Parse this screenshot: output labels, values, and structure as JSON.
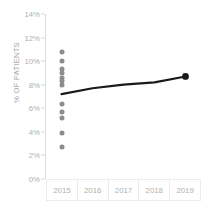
{
  "chart_data": {
    "type": "scatter",
    "title": "",
    "xlabel": "",
    "ylabel": "% OF PATIENTS",
    "categories": [
      "2015",
      "2016",
      "2017",
      "2018",
      "2019"
    ],
    "ylim": [
      0,
      14
    ],
    "ytick_labels": [
      "0%",
      "2%",
      "4%",
      "6%",
      "8%",
      "10%",
      "12%",
      "14%"
    ],
    "ytick_values": [
      0,
      2,
      4,
      6,
      8,
      10,
      12,
      14
    ],
    "grid": false,
    "legend": "none",
    "series": [
      {
        "name": "Individual site rates",
        "type": "scatter",
        "color": "#8c8c8c",
        "x": [
          "2015",
          "2015",
          "2015",
          "2015",
          "2015",
          "2015",
          "2015",
          "2015",
          "2015",
          "2015",
          "2015",
          "2015"
        ],
        "values": [
          10.8,
          10.0,
          9.3,
          9.0,
          8.6,
          8.3,
          8.0,
          6.4,
          5.7,
          5.2,
          3.9,
          2.7
        ]
      },
      {
        "name": "Overall rate",
        "type": "line",
        "color": "#1a1a1a",
        "categories": [
          "2015",
          "2016",
          "2017",
          "2018",
          "2019"
        ],
        "values": [
          7.2,
          7.7,
          8.0,
          8.2,
          8.7
        ],
        "marker_at": "2019",
        "marker_value": 8.7
      }
    ]
  },
  "axis": {
    "y_title": "% OF PATIENTS",
    "y_ticks": [
      {
        "label": "14%",
        "value": 14
      },
      {
        "label": "12%",
        "value": 12
      },
      {
        "label": "10%",
        "value": 10
      },
      {
        "label": "8%",
        "value": 8
      },
      {
        "label": "6%",
        "value": 6
      },
      {
        "label": "4%",
        "value": 4
      },
      {
        "label": "2%",
        "value": 2
      },
      {
        "label": "0%",
        "value": 0
      }
    ],
    "x_ticks": [
      {
        "label": "2015"
      },
      {
        "label": "2016"
      },
      {
        "label": "2017"
      },
      {
        "label": "2018"
      },
      {
        "label": "2019"
      }
    ]
  },
  "colors": {
    "dot": "#8c8c8c",
    "line": "#1a1a1a",
    "axis": "#dcdcdc",
    "tick_text": "#b0b0b0",
    "grid_border": "#ebebeb",
    "background": "#ffffff"
  }
}
